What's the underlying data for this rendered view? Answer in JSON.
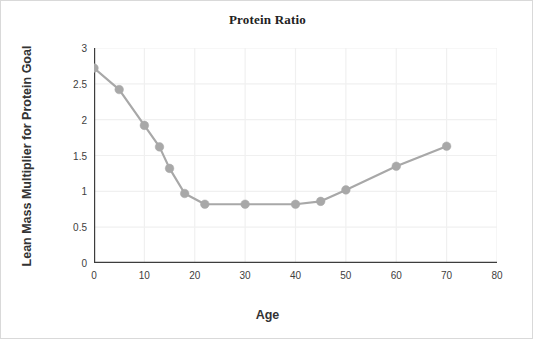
{
  "chart_data": {
    "type": "line",
    "title": "Protein Ratio",
    "xlabel": "Age",
    "ylabel": "Lean Mass Multiplier for Protein Goal",
    "xlim": [
      0,
      80
    ],
    "ylim": [
      0,
      3
    ],
    "grid": true,
    "legend": "none",
    "xticks": [
      0,
      10,
      20,
      30,
      40,
      50,
      60,
      70,
      80
    ],
    "xtick_labels": [
      "0",
      "10",
      "20",
      "30",
      "40",
      "50",
      "60",
      "70",
      "80"
    ],
    "yticks": [
      0,
      0.5,
      1,
      1.5,
      2,
      2.5,
      3
    ],
    "ytick_labels": [
      "0",
      "0.5",
      "1",
      "1.5",
      "2",
      "2.5",
      "3"
    ],
    "series": [
      {
        "name": "Lean Mass Multiplier for Protein Goal",
        "color": "#a8a8a8",
        "marker": "circle",
        "x": [
          0,
          5,
          10,
          13,
          15,
          18,
          22,
          30,
          40,
          45,
          50,
          60,
          70
        ],
        "y": [
          2.72,
          2.42,
          1.92,
          1.62,
          1.32,
          0.97,
          0.82,
          0.82,
          0.82,
          0.86,
          1.02,
          1.35,
          1.63
        ]
      }
    ]
  },
  "style": {
    "axis_color": "#3d3d3d",
    "grid_color": "#f0f0f0",
    "line_color": "#a8a8a8",
    "marker_color": "#a8a8a8",
    "background": "#ffffff",
    "border_color": "#d9d9d9"
  }
}
